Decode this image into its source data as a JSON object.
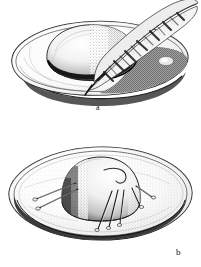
{
  "plate": {
    "title": "Hat with feather and hat with hat-pins",
    "medium": "stipple-and-line engraving",
    "background_color": "#ffffff",
    "ink_color": "#1a1a1a",
    "width_px": 201,
    "height_px": 267,
    "figure_count": 2
  },
  "figures": [
    {
      "id": "a",
      "caption": "a",
      "label": "Hat with feather trim, three-quarter view",
      "subject": "wide-brimmed soft hat seen from above-left, rounded crown, dark hat band, long barred feather laid across the crown with its tip rising to the upper right",
      "parts": [
        {
          "name": "brim",
          "note": "wide oval brim, rolled edge drawn as a double line, deep shadow beneath the lower-right edge"
        },
        {
          "name": "crown",
          "note": "rounded dome, stippled shading on the right side"
        },
        {
          "name": "hat-band",
          "note": "dark narrow band encircling the base of the crown"
        },
        {
          "name": "feather",
          "note": "long quill with barred light-and-dark vane markings, tip at upper right"
        },
        {
          "name": "pin-head",
          "note": "small light ornament on the shadowed right brim"
        }
      ]
    },
    {
      "id": "b",
      "caption": "b",
      "label": "Hat with hat-pins, front view",
      "subject": "same wide oval brim seen nearly edge-on, tall rounded crown at centre, several straight hat-pins pushed through the crown and brim",
      "parts": [
        {
          "name": "brim",
          "note": "broad flattened oval, rolled double-line edge, stipple shading around the rim"
        },
        {
          "name": "crown",
          "note": "tall rounded crown, shaded dark on its left flank"
        },
        {
          "name": "curl-mark",
          "note": "small hooked curl drawn on the top right of the crown"
        },
        {
          "name": "hat-pins",
          "note": "seven long straight pins: two on the left angled down-left, five on the right fanning down-right"
        }
      ]
    }
  ],
  "captions": {
    "a": "a",
    "b": "b"
  }
}
